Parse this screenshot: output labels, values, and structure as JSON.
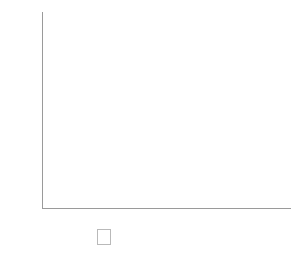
{
  "chart_data": {
    "type": "bar",
    "subtype": "stacked-100-percent",
    "title": "",
    "xlabel": "",
    "ylabel": "",
    "categories": [
      "1975",
      "1985",
      "1995",
      "2005",
      "2015"
    ],
    "series": [
      {
        "name": "Tangibles",
        "color": "#d2d2d2",
        "values": [
          83,
          68,
          32,
          20,
          13
        ],
        "labels": [
          "83%",
          "68%",
          "32%",
          "20%",
          "13%"
        ]
      },
      {
        "name": "Intangibles",
        "color": "#4b4b4b",
        "values": [
          17,
          32,
          68,
          80,
          87
        ],
        "labels": [
          "17%",
          "32%",
          "68%",
          "80%",
          "87%"
        ]
      }
    ],
    "ylim": [
      0,
      100
    ],
    "ytick_values": [
      0,
      10,
      20,
      30,
      40,
      50,
      60,
      70,
      80,
      90,
      100
    ],
    "ytick_labels": [
      "0%",
      "10%",
      "20%",
      "30%",
      "40%",
      "50%",
      "60%",
      "70%",
      "80%",
      "90%",
      "100%"
    ],
    "grid": true,
    "legend_position": "bottom"
  },
  "legend": {
    "items": [
      {
        "label": "Tangibles",
        "swatch": "swatch-tangibles-icon"
      },
      {
        "label": "Intangibles",
        "swatch": "swatch-intangibles-icon"
      }
    ]
  },
  "colors": {
    "tangibles": "#d2d2d2",
    "intangibles": "#4b4b4b",
    "gridline": "#d9d9d9",
    "axis": "#9a9a9a",
    "text": "#2f2f2f",
    "background": "#ffffff"
  }
}
